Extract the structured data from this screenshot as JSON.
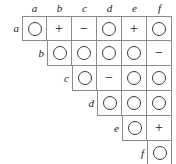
{
  "figure": {
    "name": "upper-triangular-symbol-matrix",
    "labels": [
      "a",
      "b",
      "c",
      "d",
      "e",
      "f"
    ],
    "symbols": {
      "circle": "circle-symbol",
      "plus": "+",
      "minus": "−"
    },
    "colors": {
      "background": "#ffffff",
      "rule": "#8b8b8b",
      "glyph": "#1a1a1a",
      "circle_stroke": "#3a3a3a"
    },
    "geometry": {
      "cell_size": 25,
      "grid_left": 22,
      "grid_top": 16
    },
    "column_headers": [
      "a",
      "b",
      "c",
      "d",
      "e",
      "f"
    ],
    "row_headers": [
      "a",
      "b",
      "c",
      "d",
      "e",
      "f"
    ],
    "rows": [
      {
        "label": "a",
        "start_column": 0,
        "cells": [
          "circle",
          "plus",
          "minus",
          "circle",
          "plus",
          "circle"
        ]
      },
      {
        "label": "b",
        "start_column": 1,
        "cells": [
          "circle",
          "circle",
          "circle",
          "circle",
          "minus"
        ]
      },
      {
        "label": "c",
        "start_column": 2,
        "cells": [
          "circle",
          "minus",
          "circle",
          "circle"
        ]
      },
      {
        "label": "d",
        "start_column": 3,
        "cells": [
          "circle",
          "circle",
          "circle"
        ]
      },
      {
        "label": "e",
        "start_column": 4,
        "cells": [
          "circle",
          "plus"
        ]
      },
      {
        "label": "f",
        "start_column": 5,
        "cells": [
          "circle"
        ]
      }
    ]
  }
}
